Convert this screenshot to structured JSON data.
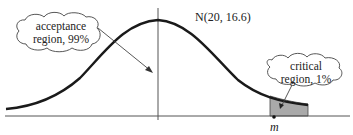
{
  "diagram": {
    "distribution_label": "N(20, 16.6)",
    "acceptance": {
      "line1": "acceptance",
      "line2": "region, 99%"
    },
    "critical": {
      "line1": "critical",
      "line2": "region, 1%"
    },
    "marker_label": "m",
    "colors": {
      "curve": "#1a1a1a",
      "axis": "#555555",
      "shade": "#a9a9a9",
      "cloud_stroke": "#444444"
    }
  }
}
